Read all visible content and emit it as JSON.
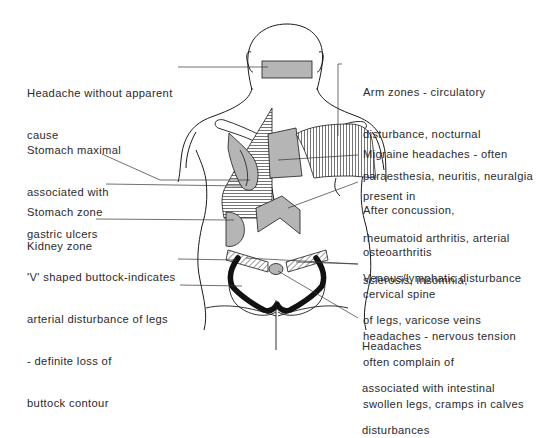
{
  "diagram": {
    "type": "anatomical-reflex-zone-chart",
    "view": "posterior torso (back view)",
    "colors": {
      "line": "#1a1a1a",
      "zone_fill": "#b5b5b5",
      "hatch": "#3a3a3a",
      "text": "#2a2a2a",
      "background": "#ffffff"
    },
    "labels_left": [
      {
        "id": "headache-no-cause",
        "lines": [
          "Headache without apparent",
          "cause"
        ]
      },
      {
        "id": "stomach-maximal",
        "lines": [
          "Stomach maximal",
          "associated with",
          "gastric ulcers"
        ]
      },
      {
        "id": "stomach-zone",
        "lines": [
          "Stomach zone"
        ]
      },
      {
        "id": "kidney-zone",
        "lines": [
          "Kidney zone"
        ]
      },
      {
        "id": "v-buttock",
        "lines": [
          "'V' shaped buttock-indicates",
          "arterial disturbance of legs",
          "- definite loss of",
          "buttock contour"
        ]
      }
    ],
    "labels_right": [
      {
        "id": "arm-zones",
        "lines": [
          "Arm zones - circulatory",
          "disturbance, nocturnal",
          "paraesthesia, neuritis, neuralgia"
        ]
      },
      {
        "id": "migraine",
        "lines": [
          "Migraine headaches - often",
          "present in",
          "rheumatoid arthritis, arterial",
          "sclerosis, insomnia,"
        ]
      },
      {
        "id": "after-concussion",
        "lines": [
          "After concussion,",
          "osteoarthritis",
          "cervical spine",
          "headaches - nervous tension"
        ]
      },
      {
        "id": "venous-lymphatic",
        "lines": [
          "Venous/lymphatic disturbance",
          "of legs, varicose veins",
          "often complain of",
          "swollen legs, cramps in calves"
        ]
      },
      {
        "id": "intestinal-headaches",
        "lines": [
          "Headaches",
          "associated with intestinal",
          "disturbances"
        ]
      }
    ]
  }
}
